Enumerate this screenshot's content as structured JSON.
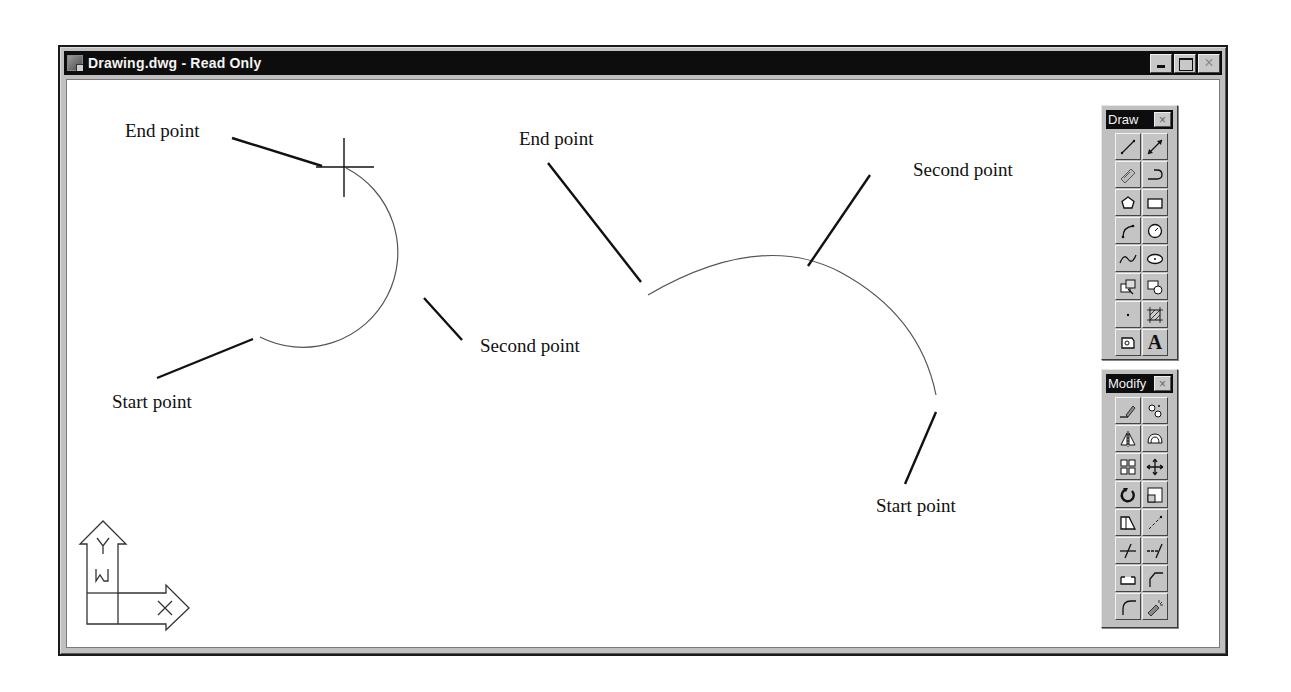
{
  "window": {
    "title": "Drawing.dwg - Read Only",
    "buttons": {
      "minimize": "minimize",
      "maximize": "maximize",
      "close": "×"
    }
  },
  "drawing": {
    "left_arc": {
      "labels": {
        "end": "End point",
        "second": "Second point",
        "start": "Start point"
      }
    },
    "right_arc": {
      "labels": {
        "end": "End point",
        "second": "Second point",
        "start": "Start point"
      }
    }
  },
  "ucs_icon": {
    "y_label": "Y",
    "x_label": "X",
    "w_label": "W"
  },
  "toolbars": {
    "draw": {
      "title": "Draw",
      "close": "×",
      "tools": [
        {
          "name": "line",
          "icon": "line-icon"
        },
        {
          "name": "construction-line",
          "icon": "construction-line-icon"
        },
        {
          "name": "multiline",
          "icon": "multiline-icon"
        },
        {
          "name": "polyline",
          "icon": "polyline-icon"
        },
        {
          "name": "polygon",
          "icon": "polygon-icon"
        },
        {
          "name": "rectangle",
          "icon": "rectangle-icon"
        },
        {
          "name": "arc",
          "icon": "arc-icon"
        },
        {
          "name": "circle",
          "icon": "circle-icon"
        },
        {
          "name": "spline",
          "icon": "spline-icon"
        },
        {
          "name": "ellipse",
          "icon": "ellipse-icon"
        },
        {
          "name": "insert-block",
          "icon": "insert-block-icon"
        },
        {
          "name": "make-block",
          "icon": "make-block-icon"
        },
        {
          "name": "point",
          "icon": "point-icon"
        },
        {
          "name": "hatch",
          "icon": "hatch-icon"
        },
        {
          "name": "region",
          "icon": "region-icon"
        },
        {
          "name": "multiline-text",
          "icon": "text-icon",
          "glyph": "A"
        }
      ]
    },
    "modify": {
      "title": "Modify",
      "close": "×",
      "tools": [
        {
          "name": "erase",
          "icon": "erase-icon"
        },
        {
          "name": "copy",
          "icon": "copy-icon"
        },
        {
          "name": "mirror",
          "icon": "mirror-icon"
        },
        {
          "name": "offset",
          "icon": "offset-icon"
        },
        {
          "name": "array",
          "icon": "array-icon"
        },
        {
          "name": "move",
          "icon": "move-icon"
        },
        {
          "name": "rotate",
          "icon": "rotate-icon"
        },
        {
          "name": "scale",
          "icon": "scale-icon"
        },
        {
          "name": "stretch",
          "icon": "stretch-icon"
        },
        {
          "name": "lengthen",
          "icon": "lengthen-icon"
        },
        {
          "name": "trim",
          "icon": "trim-icon"
        },
        {
          "name": "extend",
          "icon": "extend-icon"
        },
        {
          "name": "break",
          "icon": "break-icon"
        },
        {
          "name": "chamfer",
          "icon": "chamfer-icon"
        },
        {
          "name": "fillet",
          "icon": "fillet-icon"
        },
        {
          "name": "explode",
          "icon": "explode-icon"
        }
      ]
    }
  },
  "colors": {
    "titlebar": "#0d0d0d",
    "chrome": "#c0c0c0",
    "canvas": "#ffffff",
    "ink": "#111111"
  }
}
